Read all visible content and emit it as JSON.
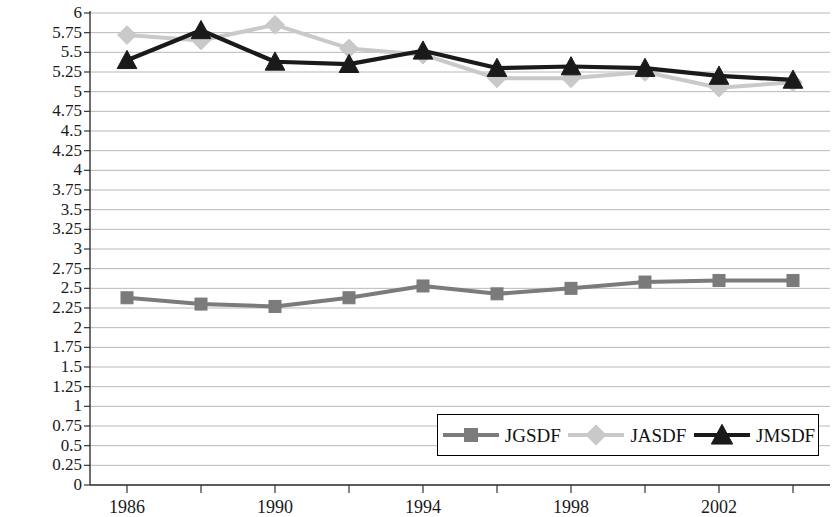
{
  "chart_data": {
    "type": "line",
    "title": "",
    "subtitle": "",
    "xlabel": "",
    "ylabel": "",
    "x": [
      1986,
      1988,
      1990,
      1992,
      1994,
      1996,
      1998,
      2000,
      2002,
      2004
    ],
    "x_tick_labels": [
      "1986",
      "1990",
      "1994",
      "1998",
      "2002"
    ],
    "x_tick_values": [
      1986,
      1990,
      1994,
      1998,
      2002
    ],
    "xlim": [
      1985,
      2005
    ],
    "ylim": [
      0,
      6
    ],
    "y_tick_labels": [
      "6",
      "5.75",
      "5.5",
      "5.25",
      "5",
      "4.75",
      "4.5",
      "4.25",
      "4",
      "3.75",
      "3.5",
      "3.25",
      "3",
      "2.75",
      "2.5",
      "2.25",
      "2",
      "1.75",
      "1.5",
      "1.25",
      "1",
      "0.75",
      "0.5",
      "0.25",
      "0"
    ],
    "y_tick_values": [
      6,
      5.75,
      5.5,
      5.25,
      5,
      4.75,
      4.5,
      4.25,
      4,
      3.75,
      3.5,
      3.25,
      3,
      2.75,
      2.5,
      2.25,
      2,
      1.75,
      1.5,
      1.25,
      1,
      0.75,
      0.5,
      0.25,
      0
    ],
    "grid": true,
    "grid_color": "#b8b8b8",
    "legend_position": "bottom-right",
    "series": [
      {
        "name": "JGSDF",
        "color": "#7b7b7b",
        "marker": "square",
        "values": [
          2.38,
          2.3,
          2.27,
          2.38,
          2.53,
          2.43,
          2.5,
          2.58,
          2.6,
          2.6
        ]
      },
      {
        "name": "JASDF",
        "color": "#c9c9c9",
        "marker": "diamond",
        "values": [
          5.72,
          5.65,
          5.85,
          5.55,
          5.47,
          5.17,
          5.17,
          5.25,
          5.05,
          5.12
        ]
      },
      {
        "name": "JMSDF",
        "color": "#1a1a1a",
        "marker": "triangle",
        "values": [
          5.4,
          5.78,
          5.38,
          5.35,
          5.52,
          5.3,
          5.32,
          5.3,
          5.2,
          5.15
        ]
      }
    ]
  },
  "legend": {
    "items": [
      {
        "label": "JGSDF",
        "marker": "square",
        "color": "#7b7b7b"
      },
      {
        "label": "JASDF",
        "marker": "diamond",
        "color": "#c9c9c9"
      },
      {
        "label": "JMSDF",
        "marker": "triangle",
        "color": "#1a1a1a"
      }
    ]
  },
  "axes": {
    "axis_color": "#333333",
    "plot_left_px": 90,
    "plot_right_px": 830,
    "plot_top_px": 13,
    "plot_bottom_px": 485
  }
}
